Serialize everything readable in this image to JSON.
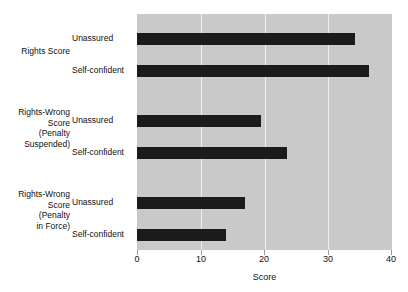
{
  "chart_data": {
    "type": "bar",
    "orientation": "horizontal",
    "title": "",
    "xlabel": "Score",
    "ylabel": "",
    "xlim": [
      0,
      40
    ],
    "xticks": [
      0,
      10,
      20,
      30,
      40
    ],
    "xtick_labels": [
      "0",
      "10",
      "20",
      "30",
      "40"
    ],
    "grid": true,
    "legend": "none",
    "bar_color": "#1b1b1b",
    "plot_background": "#c9c9c9",
    "gridline_color": "#eeeeee",
    "groups": [
      {
        "label": "Rights Score",
        "label_lines": [
          "Rights Score"
        ],
        "bars": [
          {
            "series": "Unassured",
            "value": 34.2
          },
          {
            "series": "Self-confident",
            "value": 36.4
          }
        ]
      },
      {
        "label": "Rights-Wrong Score (Penalty Suspended)",
        "label_lines": [
          "Rights-Wrong",
          "Score",
          "(Penalty",
          "Suspended)"
        ],
        "bars": [
          {
            "series": "Unassured",
            "value": 19.5
          },
          {
            "series": "Self-confident",
            "value": 23.5
          }
        ]
      },
      {
        "label": "Rights-Wrong Score (Penalty in Force)",
        "label_lines": [
          "Rights-Wrong",
          "Score",
          "(Penalty",
          "in Force)"
        ],
        "bars": [
          {
            "series": "Unassured",
            "value": 17.0
          },
          {
            "series": "Self-confident",
            "value": 14.0
          }
        ]
      }
    ],
    "categories": [
      "Rights Score - Unassured",
      "Rights Score - Self-confident",
      "Rights-Wrong Score (Penalty Suspended) - Unassured",
      "Rights-Wrong Score (Penalty Suspended) - Self-confident",
      "Rights-Wrong Score (Penalty in Force) - Unassured",
      "Rights-Wrong Score (Penalty in Force) - Self-confident"
    ],
    "values": [
      34.2,
      36.4,
      19.5,
      23.5,
      17.0,
      14.0
    ]
  },
  "axis": {
    "title": "Score",
    "ticks": [
      "0",
      "10",
      "20",
      "30",
      "40"
    ]
  },
  "groups": {
    "g0": {
      "line0": "Rights Score"
    },
    "g1": {
      "line0": "Rights-Wrong",
      "line1": "Score",
      "line2": "(Penalty",
      "line3": "Suspended)"
    },
    "g2": {
      "line0": "Rights-Wrong",
      "line1": "Score",
      "line2": "(Penalty",
      "line3": "in Force)"
    }
  },
  "series_labels": {
    "b0": "Unassured",
    "b1": "Self-confident",
    "b2": "Unassured",
    "b3": "Self-confident",
    "b4": "Unassured",
    "b5": "Self-confident"
  }
}
